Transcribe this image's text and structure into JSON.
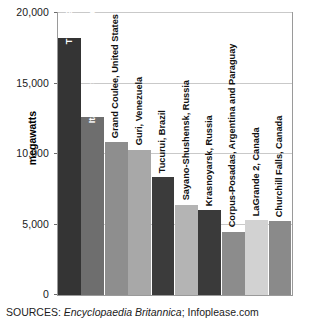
{
  "chart_data": {
    "type": "bar",
    "title": "",
    "xlabel": "",
    "ylabel": "megawatts",
    "ylim": [
      0,
      20000
    ],
    "grid": true,
    "legend": "none",
    "orientation": "vertical",
    "categories": [
      "Three Gorges, China",
      "Itaipu, Brazil and Paraguay",
      "Grand Coulee, United States",
      "Guri, Venezuela",
      "Tucurui, Brazil",
      "Sayano-Shushensk, Russia",
      "Krasnoyarsk, Russia",
      "Corpus-Posadas, Argentina and Paraguay",
      "LaGrande 2, Canada",
      "Churchill Falls, Canada"
    ],
    "values": [
      18200,
      12600,
      10830,
      10300,
      8370,
      6400,
      6000,
      4500,
      5328,
      5225
    ],
    "yticks": [
      0,
      5000,
      10000,
      15000,
      20000
    ],
    "ytick_labels": [
      "0",
      "5,000",
      "10,000",
      "15,000",
      "20,000"
    ],
    "bar_colors": [
      "#343434",
      "#6e6e6e",
      "#8e8e8e",
      "#a8a8a8",
      "#3b3b3b",
      "#b4b4b4",
      "#3a3a3a",
      "#8c8c8c",
      "#d2d2d2",
      "#8a8a8a"
    ],
    "label_placement": [
      "inside",
      "inside",
      "outside",
      "outside",
      "outside",
      "outside",
      "outside",
      "outside",
      "outside",
      "outside"
    ]
  },
  "axis": {
    "y_title": "megawatts"
  },
  "footer": {
    "sources_prefix": "SOURCES:",
    "source_italic": "Encyclopaedia Britannica",
    "source_separator": ";",
    "source_plain": "Infoplease.com"
  },
  "colors": {
    "gridline": "#c9c9c9",
    "frame": "#9a9a9a",
    "text": "#1a1a1a",
    "background": "#ffffff"
  }
}
